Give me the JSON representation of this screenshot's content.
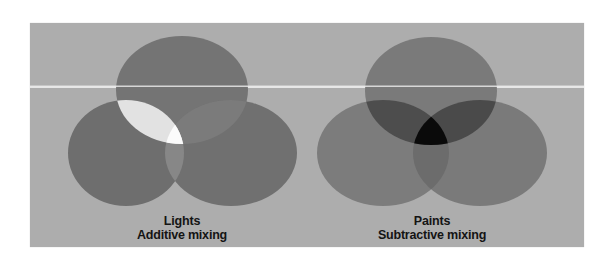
{
  "figure": {
    "background_color": "#adadad",
    "divider_line_color": "#e6e6e6",
    "diagrams": [
      {
        "id": "lights",
        "title": "Lights",
        "subtitle": "Additive mixing",
        "circles": [
          {
            "name": "top",
            "cx": 182,
            "cy": 90,
            "rx": 66,
            "ry": 54,
            "color": "#747474"
          },
          {
            "name": "left",
            "cx": 126,
            "cy": 153,
            "rx": 58,
            "ry": 53,
            "color": "#6e6e6e"
          },
          {
            "name": "right",
            "cx": 231,
            "cy": 153,
            "rx": 66,
            "ry": 53,
            "color": "#707070"
          }
        ],
        "overlap_colors": {
          "top_left": "#e2e2e2",
          "top_right": "#7b7b7b",
          "left_right": "#878787",
          "all_three": "#fbfbfb"
        }
      },
      {
        "id": "paints",
        "title": "Paints",
        "subtitle": "Subtractive mixing",
        "circles": [
          {
            "name": "top",
            "cx": 431,
            "cy": 91,
            "rx": 66,
            "ry": 54,
            "color": "#7a7a7a"
          },
          {
            "name": "left",
            "cx": 383,
            "cy": 153,
            "rx": 66,
            "ry": 53,
            "color": "#7c7c7c"
          },
          {
            "name": "right",
            "cx": 480,
            "cy": 153,
            "rx": 67,
            "ry": 53,
            "color": "#7a7a7a"
          }
        ],
        "overlap_colors": {
          "top_left": "#4d4d4d",
          "top_right": "#4a4a4a",
          "left_right": "#6c6c6c",
          "all_three": "#0a0a0a"
        }
      }
    ]
  }
}
